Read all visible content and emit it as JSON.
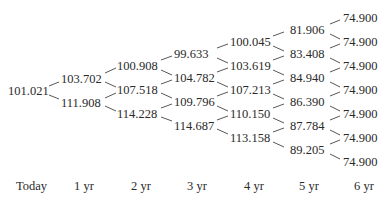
{
  "tree": {
    "columns": [
      {
        "label": "Today",
        "values": [
          "101.021"
        ]
      },
      {
        "label": "1 yr",
        "values": [
          "103.702",
          "111.908"
        ]
      },
      {
        "label": "2 yr",
        "values": [
          "100.908",
          "107.518",
          "114.228"
        ]
      },
      {
        "label": "3 yr",
        "values": [
          "99.633",
          "104.782",
          "109.796",
          "114.687"
        ]
      },
      {
        "label": "4 yr",
        "values": [
          "100.045",
          "103.619",
          "107.213",
          "110.150",
          "113.158"
        ]
      },
      {
        "label": "5 yr",
        "values": [
          "81.906",
          "83.408",
          "84.940",
          "86.390",
          "87.784",
          "89.205"
        ]
      },
      {
        "label": "6 yr",
        "values": [
          "74.900",
          "74.900",
          "74.900",
          "74.900",
          "74.900",
          "74.900",
          "74.900"
        ]
      }
    ]
  }
}
